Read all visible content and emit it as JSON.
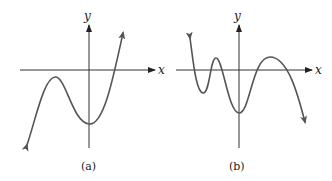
{
  "figure": {
    "panels": [
      {
        "id": "a",
        "caption": "(a)",
        "x_axis_label": "x",
        "y_axis_label": "y",
        "description": "Cubic-like curve: falls to lower-left, local maximum below x-axis left of y-axis, local minimum on negative y-axis, rises through one x-intercept right of origin"
      },
      {
        "id": "b",
        "caption": "(b)",
        "x_axis_label": "x",
        "y_axis_label": "y",
        "description": "Higher-degree polynomial curve: starts high on left, oscillates with local min, local max above axis, local min on negative y-axis, local max above axis, then falls to lower-right; four x-intercepts"
      }
    ],
    "colors": {
      "axis": "#333333",
      "curve": "#555555",
      "text": "#222222"
    }
  }
}
